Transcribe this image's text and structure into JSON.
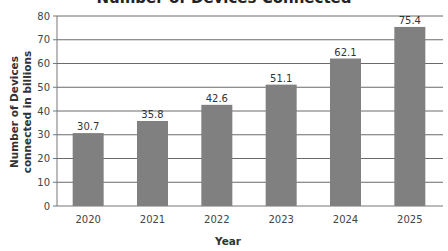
{
  "chart_data": {
    "type": "bar",
    "title": "Number of Devices Connected",
    "xlabel": "Year",
    "ylabel": "Number of Devices connected in billions",
    "categories": [
      "2020",
      "2021",
      "2022",
      "2023",
      "2024",
      "2025"
    ],
    "values": [
      30.7,
      35.8,
      42.6,
      51.1,
      62.1,
      75.4
    ],
    "data_labels": [
      "30.7",
      "35.8",
      "42.6",
      "51.1",
      "62.1",
      "75.4"
    ],
    "ylim": [
      0,
      80
    ],
    "yticks": [
      0,
      10,
      20,
      30,
      40,
      50,
      60,
      70,
      80
    ],
    "grid": true,
    "legend": null,
    "bar_color": "#808080"
  }
}
